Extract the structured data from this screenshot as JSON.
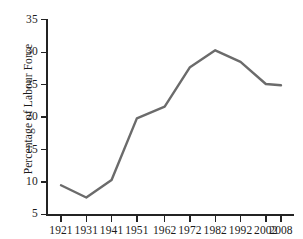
{
  "chart_data": {
    "type": "line",
    "title": "",
    "xlabel": "",
    "ylabel": "Percentage of Labour Force",
    "categories": [
      "1921",
      "1931",
      "1941",
      "1951",
      "1962",
      "1972",
      "1982",
      "1992",
      "2002",
      "2008"
    ],
    "x_positions": [
      1921,
      1931,
      1941,
      1951,
      1962,
      1972,
      1982,
      1992,
      2002,
      2008
    ],
    "values": [
      9.5,
      7.6,
      10.3,
      19.8,
      21.6,
      27.7,
      30.3,
      28.5,
      25.1,
      24.9
    ],
    "series": [
      {
        "name": "Percentage of Labour Force",
        "values": [
          9.5,
          7.6,
          10.3,
          19.8,
          21.6,
          27.7,
          30.3,
          28.5,
          25.1,
          24.9
        ],
        "color": "#6b6b6b"
      }
    ],
    "ylim": [
      5,
      35
    ],
    "yticks": [
      5,
      10,
      15,
      20,
      25,
      30,
      35
    ],
    "ytick_labels": [
      "5",
      "10",
      "15",
      "20",
      "25",
      "30",
      "35"
    ],
    "xtick_labels": [
      "1921",
      "1931",
      "1941",
      "1951",
      "1962",
      "1972",
      "1982",
      "1992",
      "2002",
      "2008"
    ],
    "grid": false,
    "legend": false,
    "legend_position": "none",
    "line_color": "#6b6b6b",
    "line_width": 2.4,
    "axis_color": "#232323",
    "background": "#ffffff",
    "markers": false,
    "spines": [
      "left",
      "bottom"
    ],
    "tick_direction": "out"
  }
}
